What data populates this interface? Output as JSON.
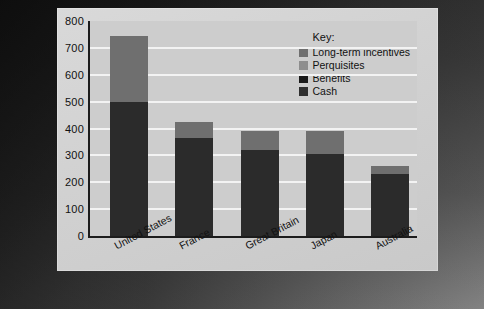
{
  "chart_data": {
    "type": "bar",
    "title": "",
    "subtitle": "",
    "xlabel": "",
    "ylabel": "",
    "stacked": true,
    "grid": true,
    "legend_position": "inside-top-right",
    "ylim": [
      0,
      800
    ],
    "yticks": [
      "800",
      "700",
      "600",
      "500",
      "400",
      "300",
      "200",
      "100",
      "0"
    ],
    "categories": [
      "United States",
      "France",
      "Great Britain",
      "Japan",
      "Australia"
    ],
    "series": [
      {
        "name": "Cash",
        "color": "#2b2b2b",
        "values": [
          500,
          365,
          320,
          305,
          230
        ]
      },
      {
        "name": "Benefits",
        "color": "#1a1a1a",
        "values": [
          0,
          0,
          0,
          0,
          0
        ]
      },
      {
        "name": "Perquisites",
        "color": "#8e8e8e",
        "values": [
          0,
          0,
          0,
          0,
          0
        ]
      },
      {
        "name": "Long-term incentives",
        "color": "#6f6f6f",
        "values": [
          245,
          60,
          70,
          85,
          30
        ]
      }
    ],
    "totals": [
      745,
      425,
      390,
      390,
      260
    ]
  },
  "legend": {
    "title": "Key:",
    "entries": [
      {
        "label": "Long-term incentives",
        "color": "#6f6f6f"
      },
      {
        "label": "Perquisites",
        "color": "#8e8e8e"
      },
      {
        "label": "Benefits",
        "color": "#1a1a1a"
      },
      {
        "label": "Cash",
        "color": "#2f2f2f"
      }
    ]
  },
  "colors": {
    "plot_background": "#cdcdcd",
    "card_background": "#d4d4d4",
    "gridline": "#f3f3f3",
    "axis": "#1c1c1c",
    "text": "#111111"
  }
}
